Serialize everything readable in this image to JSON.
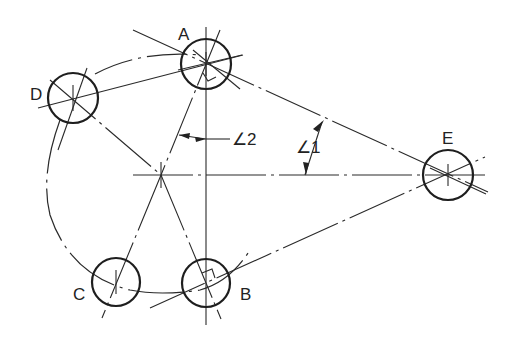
{
  "diagram": {
    "type": "belt-drive-pulley-layout",
    "pulleys": [
      {
        "id": "A",
        "label": "A"
      },
      {
        "id": "B",
        "label": "B"
      },
      {
        "id": "C",
        "label": "C"
      },
      {
        "id": "D",
        "label": "D"
      },
      {
        "id": "E",
        "label": "E"
      }
    ],
    "angle_labels": {
      "angle1": "∠1",
      "angle2": "∠2"
    },
    "right_angle_marks": [
      "A",
      "B"
    ],
    "colors": {
      "ink": "#222222",
      "background": "#ffffff"
    }
  }
}
